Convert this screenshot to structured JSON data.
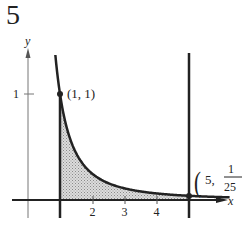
{
  "problem_number": "5",
  "chart_data": {
    "type": "area",
    "title": "",
    "function": "y = 1/x^2",
    "xlabel": "x",
    "ylabel": "y",
    "x_ticks": [
      "2",
      "3",
      "4"
    ],
    "y_ticks": [
      "1"
    ],
    "xlim": [
      -0.5,
      6
    ],
    "ylim": [
      -0.2,
      1.4
    ],
    "shaded_region": {
      "x_from": 1,
      "x_to": 5,
      "description": "area under y = 1/x^2"
    },
    "vertical_lines": [
      1,
      5
    ],
    "points": [
      {
        "label": "(1, 1)",
        "x": 1,
        "y": 1
      },
      {
        "label_prefix": "(5,",
        "numerator": "1",
        "denominator": "25",
        "label_suffix": ")",
        "x": 5,
        "y": 0.04
      }
    ],
    "grid": false,
    "legend": null
  },
  "labels": {
    "x_axis": "x",
    "y_axis": "y",
    "y_tick_1": "1",
    "x_tick_2": "2",
    "x_tick_3": "3",
    "x_tick_4": "4",
    "point1": "(1,  1)",
    "point2_prefix": "5,",
    "point2_num": "1",
    "point2_den": "25"
  }
}
